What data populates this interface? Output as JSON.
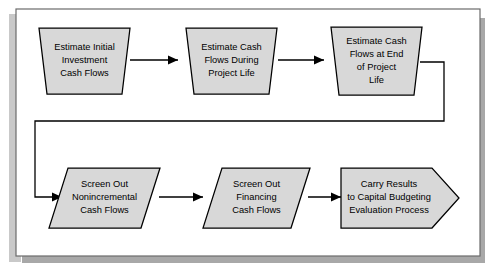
{
  "figure": {
    "frame": {
      "border_color": "#6b6b6b",
      "shadow_color": "#a8a8a8",
      "background_color": "#ffffff"
    },
    "style": {
      "shape_fill": "#d8d8d8",
      "shape_stroke": "#000000",
      "connector_color": "#000000",
      "text_color": "#000000"
    }
  },
  "nodes": [
    {
      "id": "estimate-initial-investment-cash-flows",
      "shape": "trapezoid",
      "row": "top",
      "order": 1,
      "lines": [
        "Estimate Initial",
        "Investment",
        "Cash Flows"
      ]
    },
    {
      "id": "estimate-cash-flows-during-project-life",
      "shape": "trapezoid",
      "row": "top",
      "order": 2,
      "lines": [
        "Estimate Cash",
        "Flows During",
        "Project Life"
      ]
    },
    {
      "id": "estimate-cash-flows-at-end-of-project-life",
      "shape": "trapezoid",
      "row": "top",
      "order": 3,
      "lines": [
        "Estimate Cash",
        "Flows at End",
        "of Project",
        "Life"
      ]
    },
    {
      "id": "screen-out-nonincremental-cash-flows",
      "shape": "parallelogram",
      "row": "bottom",
      "order": 1,
      "lines": [
        "Screen Out",
        "Nonincremental",
        "Cash Flows"
      ]
    },
    {
      "id": "screen-out-financing-cash-flows",
      "shape": "parallelogram",
      "row": "bottom",
      "order": 2,
      "lines": [
        "Screen Out",
        "Financing",
        "Cash Flows"
      ]
    },
    {
      "id": "carry-results-to-capital-budgeting-evaluation-process",
      "shape": "arrow-pentagon",
      "row": "bottom",
      "order": 3,
      "lines": [
        "Carry Results",
        "to Capital Budgeting",
        "Evaluation Process"
      ]
    }
  ],
  "connectors": [
    {
      "id": "c1",
      "from": "estimate-initial-investment-cash-flows",
      "to": "estimate-cash-flows-during-project-life",
      "style": "straight-right"
    },
    {
      "id": "c2",
      "from": "estimate-cash-flows-during-project-life",
      "to": "estimate-cash-flows-at-end-of-project-life",
      "style": "straight-right"
    },
    {
      "id": "c3",
      "from": "estimate-cash-flows-at-end-of-project-life",
      "to": "screen-out-nonincremental-cash-flows",
      "style": "wrap-around-right-down-left-down-right"
    },
    {
      "id": "c4",
      "from": "screen-out-nonincremental-cash-flows",
      "to": "screen-out-financing-cash-flows",
      "style": "straight-right"
    },
    {
      "id": "c5",
      "from": "screen-out-financing-cash-flows",
      "to": "carry-results-to-capital-budgeting-evaluation-process",
      "style": "straight-right"
    }
  ]
}
